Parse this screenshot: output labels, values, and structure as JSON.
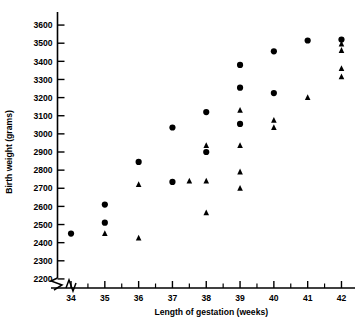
{
  "chart_data": {
    "type": "scatter",
    "title": "",
    "xlabel": "Length of gestation (weeks)",
    "ylabel": "Birth weight (grams)",
    "xlim": [
      33.6,
      42.4
    ],
    "ylim": [
      2150,
      3650
    ],
    "grid": false,
    "legend_position": "none",
    "axis_break_x": true,
    "axis_break_y": true,
    "x_ticks": [
      34,
      35,
      36,
      37,
      38,
      39,
      40,
      41,
      42
    ],
    "x_tick_labels": [
      "34",
      "35",
      "36",
      "37",
      "38",
      "39",
      "40",
      "41",
      "42"
    ],
    "x_minor_ticks": [
      34.5,
      35.5,
      36.5,
      37.5,
      38.5,
      39.5,
      40.5,
      41.5
    ],
    "y_ticks": [
      2200,
      2300,
      2400,
      2500,
      2600,
      2700,
      2800,
      2900,
      3000,
      3100,
      3200,
      3300,
      3400,
      3500,
      3600
    ],
    "y_tick_labels": [
      "2200",
      "2300",
      "2400",
      "2500",
      "2600",
      "2700",
      "2800",
      "2900",
      "3000",
      "3100",
      "3200",
      "3300",
      "3400",
      "3500",
      "3600"
    ],
    "series": [
      {
        "name": "circle-group",
        "marker": "circle",
        "color": "#000000",
        "points": [
          {
            "x": 34.0,
            "y": 2450
          },
          {
            "x": 35.0,
            "y": 2610
          },
          {
            "x": 35.0,
            "y": 2510
          },
          {
            "x": 36.0,
            "y": 2845
          },
          {
            "x": 37.0,
            "y": 3035
          },
          {
            "x": 37.0,
            "y": 2735
          },
          {
            "x": 38.0,
            "y": 3120
          },
          {
            "x": 38.0,
            "y": 2900
          },
          {
            "x": 39.0,
            "y": 3380
          },
          {
            "x": 39.0,
            "y": 3255
          },
          {
            "x": 39.0,
            "y": 3055
          },
          {
            "x": 40.0,
            "y": 3455
          },
          {
            "x": 40.0,
            "y": 3225
          },
          {
            "x": 41.0,
            "y": 3515
          },
          {
            "x": 42.0,
            "y": 3520
          }
        ]
      },
      {
        "name": "triangle-group",
        "marker": "triangle",
        "color": "#000000",
        "points": [
          {
            "x": 35.0,
            "y": 2450
          },
          {
            "x": 36.0,
            "y": 2425
          },
          {
            "x": 36.0,
            "y": 2720
          },
          {
            "x": 37.5,
            "y": 2740
          },
          {
            "x": 38.0,
            "y": 2565
          },
          {
            "x": 38.0,
            "y": 2740
          },
          {
            "x": 38.0,
            "y": 2935
          },
          {
            "x": 39.0,
            "y": 2700
          },
          {
            "x": 39.0,
            "y": 2790
          },
          {
            "x": 39.0,
            "y": 2935
          },
          {
            "x": 39.0,
            "y": 3130
          },
          {
            "x": 40.0,
            "y": 3035
          },
          {
            "x": 40.0,
            "y": 3075
          },
          {
            "x": 41.0,
            "y": 3200
          },
          {
            "x": 42.0,
            "y": 3315
          },
          {
            "x": 42.0,
            "y": 3360
          },
          {
            "x": 42.0,
            "y": 3460
          },
          {
            "x": 42.0,
            "y": 3495
          }
        ]
      }
    ]
  }
}
